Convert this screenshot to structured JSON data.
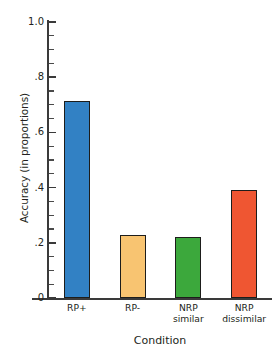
{
  "chart_data": {
    "type": "bar",
    "title": "",
    "xlabel": "Condition",
    "ylabel": "Accuracy (in proportions)",
    "categories": [
      "RP+",
      "RP-",
      "NRP similar",
      "NRP dissimilar"
    ],
    "category_lines": [
      [
        "RP+"
      ],
      [
        "RP-"
      ],
      [
        "NRP",
        "similar"
      ],
      [
        "NRP",
        "dissimilar"
      ]
    ],
    "values": [
      0.715,
      0.23,
      0.22,
      0.39
    ],
    "colors": [
      "#3281C4",
      "#F8C471",
      "#3CA83C",
      "#EF5632"
    ],
    "bar_edge_color": "#1d1d1b",
    "ylim": [
      0,
      1.0
    ],
    "xlim": [
      0,
      4
    ],
    "grid": false,
    "legend": false,
    "y_major_ticks": [
      0,
      0.2,
      0.4,
      0.6,
      0.8,
      1.0
    ],
    "y_major_tick_labels": [
      "0",
      ".2",
      ".4",
      ".6",
      ".8",
      "1.0"
    ],
    "y_minor_tick_step": 0.05,
    "axis_color": "#3a3a3a",
    "background": "#ffffff"
  }
}
